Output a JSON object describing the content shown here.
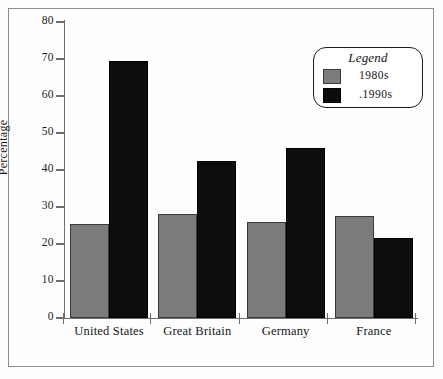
{
  "chart_data": {
    "type": "bar",
    "title": "",
    "xlabel": "",
    "ylabel": "Percentage",
    "ylim": [
      0,
      80
    ],
    "yticks": [
      0,
      10,
      20,
      30,
      40,
      50,
      60,
      70,
      80
    ],
    "ytick_labels": [
      "0",
      "10",
      "20",
      "30",
      "40",
      "50",
      "60",
      "70",
      "80"
    ],
    "grid": false,
    "categories": [
      "United States",
      "Great Britain",
      "Germany",
      "France"
    ],
    "series": [
      {
        "name": "1980s",
        "color": "#7b7b7b",
        "values": [
          25.5,
          28,
          26,
          27.5
        ]
      },
      {
        "name": "1990s",
        "color": "#0d0d0d",
        "values": [
          69.5,
          42.5,
          46,
          21.5
        ]
      }
    ],
    "legend": {
      "title": "Legend",
      "position": "upper right",
      "entries": [
        {
          "label": "1980s",
          "color": "#7b7b7b"
        },
        {
          "label": "1990s",
          "color": "#0d0d0d"
        }
      ]
    },
    "axis_color": "#6f6f6f",
    "frame_color": "#8c8c8c"
  }
}
